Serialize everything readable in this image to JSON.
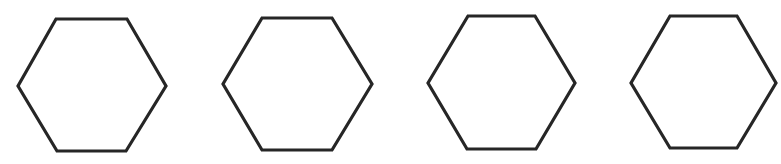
{
  "figure": {
    "width": 781,
    "height": 164,
    "background": "#ffffff",
    "stroke_color": "#262626",
    "stroke_width": 3.2,
    "shapes": [
      {
        "type": "hexagon",
        "label": "hexagon-1",
        "points": [
          [
            56,
            19
          ],
          [
            127,
            19
          ],
          [
            166,
            86
          ],
          [
            126,
            151
          ],
          [
            57,
            151
          ],
          [
            18,
            86
          ]
        ]
      },
      {
        "type": "hexagon",
        "label": "hexagon-2",
        "points": [
          [
            262,
            18
          ],
          [
            332,
            18
          ],
          [
            372,
            84
          ],
          [
            332,
            150
          ],
          [
            262,
            150
          ],
          [
            223,
            84
          ]
        ]
      },
      {
        "type": "hexagon",
        "label": "hexagon-3",
        "points": [
          [
            468,
            16
          ],
          [
            535,
            16
          ],
          [
            575,
            83
          ],
          [
            536,
            149
          ],
          [
            467,
            149
          ],
          [
            428,
            83
          ]
        ]
      },
      {
        "type": "hexagon",
        "label": "hexagon-4",
        "points": [
          [
            670,
            16
          ],
          [
            737,
            16
          ],
          [
            776,
            83
          ],
          [
            737,
            148
          ],
          [
            670,
            148
          ],
          [
            631,
            83
          ]
        ]
      }
    ]
  }
}
